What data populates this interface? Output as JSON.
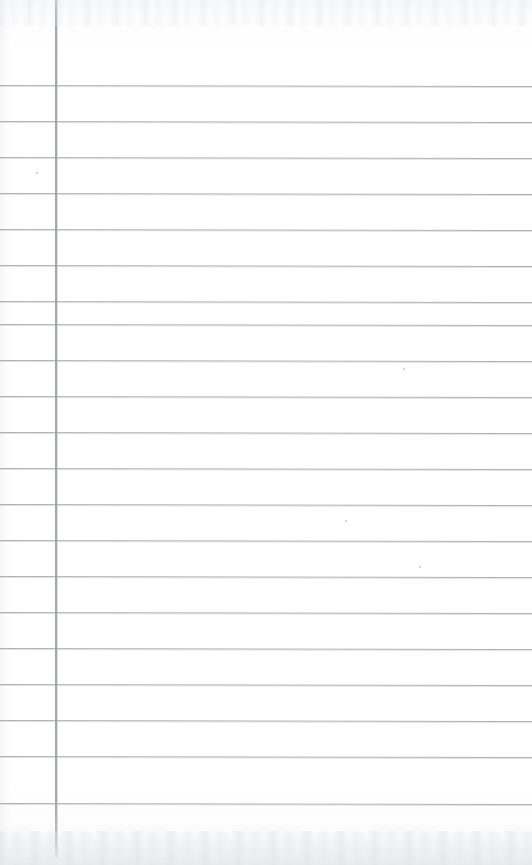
{
  "page": {
    "kind": "scanned-blank-ruled-notebook-page",
    "width": 532,
    "height": 865,
    "has_text_content": false,
    "text_content": "",
    "paper_color": "#fefefe",
    "rule_color": "#a9abae",
    "margin_rule_color": "#a0a3a7",
    "orientation": "portrait"
  },
  "ruling": {
    "type": "horizontal-ruled-with-left-margin",
    "line_count": 21,
    "first_line_y": 85,
    "last_line_y": 803,
    "line_spacing": 35.9,
    "line_thickness": 1,
    "line_start_x": 0,
    "line_end_x": 532,
    "tilt_degrees": 0.12,
    "line_y_positions": [
      85,
      121,
      157,
      193,
      229,
      265,
      301,
      324,
      360,
      396,
      432,
      468,
      504,
      540,
      576,
      612,
      648,
      684,
      720,
      756,
      803
    ]
  },
  "margin": {
    "label": "left-margin-rule",
    "x": 55,
    "width": 2,
    "top_y": 0,
    "bottom_y": 858
  },
  "artifacts": {
    "top_band_label": "scan-noise-top",
    "top_band_height": 26,
    "bottom_band_label": "scan-noise-bottom",
    "bottom_band_height": 34,
    "left_edge_label": "scan-edge-left",
    "specks": [
      {
        "x": 36,
        "y": 172,
        "size": 2
      },
      {
        "x": 403,
        "y": 368,
        "size": 2
      },
      {
        "x": 345,
        "y": 520,
        "size": 2
      },
      {
        "x": 419,
        "y": 566,
        "size": 2
      }
    ]
  }
}
